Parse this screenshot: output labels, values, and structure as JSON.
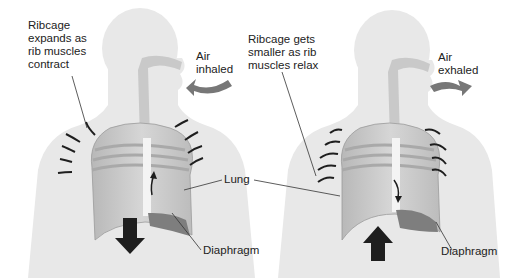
{
  "diagram": {
    "panels": [
      {
        "name": "inhalation",
        "labels": {
          "ribcage": [
            "Ribcage",
            "expands as",
            "rib muscles",
            "contract"
          ],
          "air": [
            "Air",
            "inhaled"
          ],
          "lung": "Lung",
          "diaphragm": "Diaphragm"
        },
        "diaphragm_arrow": "down"
      },
      {
        "name": "exhalation",
        "labels": {
          "ribcage": [
            "Ribcage gets",
            "smaller as rib",
            "muscles relax"
          ],
          "air": [
            "Air",
            "exhaled"
          ],
          "diaphragm": "Diaphragm"
        },
        "diaphragm_arrow": "up"
      }
    ],
    "colors": {
      "body": "#e6e6e6",
      "airway": "#c9c9c9",
      "lung": "#c8c8c8",
      "rib": "#bdbdbd",
      "diaphragm": "#8a8a8a",
      "air_arrow": "#7a7a7a",
      "arrow": "#1e1e1e",
      "text": "#222222"
    }
  }
}
